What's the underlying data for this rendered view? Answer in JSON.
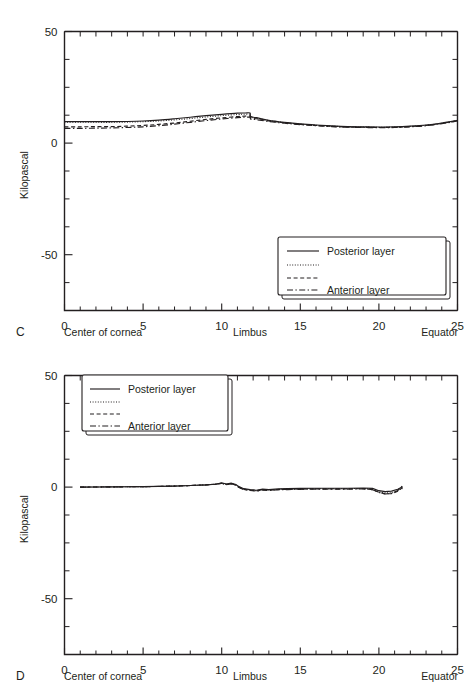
{
  "figure": {
    "panels": [
      {
        "letter": "C",
        "ylabel": "Kilopascal",
        "x_axis_names": {
          "left": "Center of cornea",
          "middle": "Limbus",
          "right": "Equator"
        },
        "legend": {
          "entries": [
            {
              "style": "solid",
              "label": "Posterior layer"
            },
            {
              "style": "dotted",
              "label": ""
            },
            {
              "style": "dashed",
              "label": ""
            },
            {
              "style": "dashdot",
              "label": "Anterior layer"
            }
          ]
        }
      },
      {
        "letter": "D",
        "ylabel": "Kilopascal",
        "x_axis_names": {
          "left": "Center of cornea",
          "middle": "Limbus",
          "right": "Equator"
        },
        "legend": {
          "entries": [
            {
              "style": "solid",
              "label": "Posterior layer"
            },
            {
              "style": "dotted",
              "label": ""
            },
            {
              "style": "dashed",
              "label": ""
            },
            {
              "style": "dashdot",
              "label": "Anterior layer"
            }
          ]
        }
      }
    ]
  },
  "chart_data": [
    {
      "type": "line",
      "panel": "C",
      "title": "",
      "xlabel": "",
      "ylabel": "Kilopascal",
      "xlim": [
        0,
        25
      ],
      "ylim": [
        -75,
        50
      ],
      "xticks": [
        0,
        5,
        10,
        15,
        20,
        25
      ],
      "yticks": [
        -50,
        0,
        50
      ],
      "ytick_labels": [
        "-50",
        "0",
        "50"
      ],
      "xtick_labels": [
        "0",
        "5",
        "10",
        "15",
        "20",
        "25"
      ],
      "grid": false,
      "legend_position": "lower-right",
      "x_annotations": [
        {
          "x": 0,
          "text": "Center of cornea"
        },
        {
          "x": 11.8,
          "text": "Limbus"
        },
        {
          "x": 25,
          "text": "Equator"
        }
      ],
      "series": [
        {
          "name": "Posterior layer",
          "style": "solid",
          "x": [
            0,
            1,
            2,
            3,
            4,
            5,
            6,
            7,
            8,
            9,
            10,
            11,
            11.5,
            11.8,
            11.85,
            12.2,
            13,
            14,
            15,
            16,
            17,
            18,
            19,
            20,
            21,
            22,
            23,
            24,
            25
          ],
          "y": [
            9.6,
            9.6,
            9.6,
            9.6,
            9.7,
            9.9,
            10.3,
            10.9,
            11.6,
            12.3,
            12.9,
            13.4,
            13.5,
            13.5,
            11.9,
            11.4,
            10.2,
            9.3,
            8.6,
            8.1,
            7.7,
            7.4,
            7.3,
            7.2,
            7.3,
            7.6,
            8.1,
            9.0,
            10.2
          ]
        },
        {
          "name": "",
          "style": "dotted",
          "x": [
            0,
            1,
            2,
            3,
            4,
            5,
            6,
            7,
            8,
            9,
            10,
            11,
            11.5,
            11.8,
            11.85,
            12.2,
            13,
            14,
            15,
            16,
            17,
            18,
            19,
            20,
            21,
            22,
            23,
            24,
            25
          ],
          "y": [
            9.3,
            9.3,
            9.3,
            9.3,
            9.4,
            9.6,
            9.9,
            10.4,
            11.0,
            11.7,
            12.3,
            12.8,
            12.9,
            12.9,
            11.6,
            11.2,
            10.1,
            9.2,
            8.5,
            8.0,
            7.6,
            7.3,
            7.2,
            7.1,
            7.2,
            7.5,
            8.0,
            8.9,
            10.1
          ]
        },
        {
          "name": "",
          "style": "dashed",
          "x": [
            0,
            1,
            2,
            3,
            4,
            5,
            6,
            7,
            8,
            9,
            10,
            11,
            11.5,
            11.8,
            11.85,
            12.2,
            13,
            14,
            15,
            16,
            17,
            18,
            19,
            20,
            21,
            22,
            23,
            24,
            25
          ],
          "y": [
            7.3,
            7.3,
            7.4,
            7.4,
            7.6,
            7.9,
            8.4,
            9.0,
            9.8,
            10.6,
            11.3,
            11.9,
            12.1,
            12.1,
            11.2,
            10.9,
            9.9,
            9.1,
            8.4,
            7.9,
            7.5,
            7.2,
            7.1,
            7.0,
            7.1,
            7.4,
            7.9,
            8.8,
            10.0
          ]
        },
        {
          "name": "Anterior layer",
          "style": "dashdot",
          "x": [
            0,
            1,
            2,
            3,
            4,
            5,
            6,
            7,
            8,
            9,
            10,
            11,
            11.5,
            11.8,
            11.85,
            12.2,
            13,
            14,
            15,
            16,
            17,
            18,
            19,
            20,
            21,
            22,
            23,
            24,
            25
          ],
          "y": [
            6.6,
            6.6,
            6.7,
            6.8,
            7.0,
            7.3,
            7.8,
            8.5,
            9.3,
            10.1,
            10.8,
            11.4,
            11.6,
            11.6,
            10.7,
            10.5,
            9.7,
            8.9,
            8.3,
            7.8,
            7.4,
            7.1,
            7.0,
            6.9,
            7.0,
            7.3,
            7.8,
            8.7,
            9.9
          ]
        }
      ]
    },
    {
      "type": "line",
      "panel": "D",
      "title": "",
      "xlabel": "",
      "ylabel": "Kilopascal",
      "xlim": [
        0,
        25
      ],
      "ylim": [
        -75,
        50
      ],
      "xticks": [
        0,
        5,
        10,
        15,
        20,
        25
      ],
      "yticks": [
        -50,
        0,
        50
      ],
      "ytick_labels": [
        "-50",
        "0",
        "50"
      ],
      "xtick_labels": [
        "0",
        "5",
        "10",
        "15",
        "20",
        "25"
      ],
      "grid": false,
      "legend_position": "upper-left",
      "x_annotations": [
        {
          "x": 0,
          "text": "Center of cornea"
        },
        {
          "x": 11.8,
          "text": "Limbus"
        },
        {
          "x": 25,
          "text": "Equator"
        }
      ],
      "series": [
        {
          "name": "Posterior layer",
          "style": "solid",
          "x": [
            1.0,
            2,
            3,
            4,
            5,
            6,
            7,
            8,
            9,
            9.6,
            10.0,
            10.3,
            10.6,
            10.9,
            11.1,
            11.4,
            11.8,
            12.2,
            12.6,
            13.0,
            13.6,
            14.2,
            15,
            16,
            17,
            18,
            19,
            19.6,
            20.0,
            20.4,
            20.8,
            21.2,
            21.5
          ],
          "y": [
            0.0,
            0.05,
            0.1,
            0.15,
            0.2,
            0.3,
            0.45,
            0.7,
            1.0,
            1.3,
            1.9,
            1.4,
            1.8,
            1.2,
            0.2,
            -0.7,
            -1.1,
            -1.4,
            -0.9,
            -1.1,
            -0.8,
            -0.7,
            -0.6,
            -0.5,
            -0.5,
            -0.5,
            -0.4,
            -0.6,
            -1.6,
            -2.0,
            -1.8,
            -1.0,
            0.2
          ]
        },
        {
          "name": "",
          "style": "dotted",
          "x": [
            1.0,
            2,
            3,
            4,
            5,
            6,
            7,
            8,
            9,
            9.6,
            10.0,
            10.3,
            10.6,
            10.9,
            11.1,
            11.4,
            11.8,
            12.2,
            12.6,
            13.0,
            13.6,
            14.2,
            15,
            16,
            17,
            18,
            19,
            19.6,
            20.0,
            20.4,
            20.8,
            21.2,
            21.5
          ],
          "y": [
            0.0,
            0.05,
            0.1,
            0.15,
            0.2,
            0.3,
            0.45,
            0.7,
            1.0,
            1.3,
            1.8,
            1.3,
            1.6,
            1.0,
            0.0,
            -0.9,
            -1.3,
            -1.6,
            -1.1,
            -1.3,
            -1.0,
            -0.9,
            -0.8,
            -0.7,
            -0.7,
            -0.7,
            -0.6,
            -0.9,
            -2.0,
            -2.6,
            -2.5,
            -1.6,
            -0.6
          ]
        },
        {
          "name": "",
          "style": "dashed",
          "x": [
            1.0,
            2,
            3,
            4,
            5,
            6,
            7,
            8,
            9,
            9.6,
            10.0,
            10.3,
            10.6,
            10.9,
            11.1,
            11.4,
            11.8,
            12.2,
            12.6,
            13.0,
            13.6,
            14.2,
            15,
            16,
            17,
            18,
            19,
            19.6,
            20.0,
            20.4,
            20.8,
            21.2,
            21.5
          ],
          "y": [
            0.0,
            0.05,
            0.1,
            0.15,
            0.2,
            0.3,
            0.45,
            0.7,
            1.0,
            1.3,
            1.7,
            1.2,
            1.5,
            0.9,
            -0.1,
            -1.0,
            -1.4,
            -1.7,
            -1.2,
            -1.4,
            -1.1,
            -1.0,
            -0.9,
            -0.8,
            -0.8,
            -0.8,
            -0.7,
            -1.1,
            -2.3,
            -3.0,
            -2.9,
            -1.9,
            -0.2
          ]
        },
        {
          "name": "Anterior layer",
          "style": "dashdot",
          "x": [
            1.0,
            2,
            3,
            4,
            5,
            6,
            7,
            8,
            9,
            9.6,
            10.0,
            10.3,
            10.6,
            10.9,
            11.1,
            11.4,
            11.8,
            12.2,
            12.6,
            13.0,
            13.6,
            14.2,
            15,
            16,
            17,
            18,
            19,
            19.6,
            20.0,
            20.4,
            20.8,
            21.2,
            21.5
          ],
          "y": [
            0.0,
            0.05,
            0.1,
            0.15,
            0.2,
            0.3,
            0.45,
            0.7,
            1.0,
            1.3,
            1.6,
            1.1,
            1.4,
            0.8,
            -0.2,
            -1.1,
            -1.5,
            -1.8,
            -1.3,
            -1.5,
            -1.2,
            -1.1,
            -1.0,
            -0.9,
            -0.9,
            -0.9,
            -0.8,
            -1.2,
            -2.4,
            -3.1,
            -2.8,
            -1.5,
            0.6
          ]
        }
      ]
    }
  ]
}
